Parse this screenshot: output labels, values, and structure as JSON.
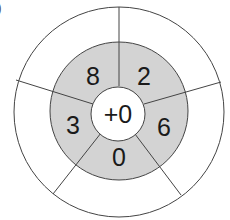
{
  "figure": {
    "corner_label": ")",
    "center_label": "+0",
    "inner_ring": [
      "2",
      "6",
      "0",
      "3",
      "8"
    ],
    "outer_ring": [
      "",
      "",
      "",
      "",
      ""
    ],
    "colors": {
      "inner_ring_fill": "#d3d3d3",
      "center_fill": "#ffffff",
      "outer_ring_fill": "#ffffff",
      "stroke": "#444444"
    }
  }
}
